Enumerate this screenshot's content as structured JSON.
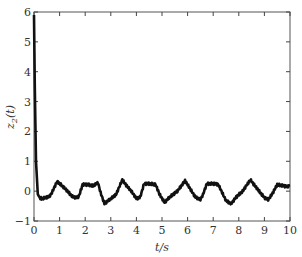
{
  "chart_data": {
    "type": "line",
    "title": "",
    "xlabel": "t/s",
    "ylabel": "z_2(t)",
    "ylabel_main": "z",
    "ylabel_sub": "2",
    "ylabel_tail": "(t)",
    "xlim": [
      0,
      10
    ],
    "ylim": [
      -1,
      6
    ],
    "xticks": [
      0,
      1,
      2,
      3,
      4,
      5,
      6,
      7,
      8,
      9,
      10
    ],
    "yticks": [
      -1,
      0,
      1,
      2,
      3,
      4,
      5,
      6
    ],
    "xtick_labels": [
      "0",
      "1",
      "2",
      "3",
      "4",
      "5",
      "6",
      "7",
      "8",
      "9",
      "10"
    ],
    "ytick_labels": [
      "−1",
      "0",
      "1",
      "2",
      "3",
      "4",
      "5",
      "6"
    ],
    "grid": false,
    "legend": null,
    "series": [
      {
        "name": "z2(t)",
        "color": "#111111",
        "x": [
          0,
          0.03,
          0.08,
          0.15,
          0.22,
          0.3,
          0.45,
          0.6,
          0.7,
          0.9,
          1.05,
          1.25,
          1.5,
          1.65,
          1.75,
          1.9,
          2.1,
          2.3,
          2.5,
          2.6,
          2.75,
          3.0,
          3.2,
          3.45,
          3.6,
          3.8,
          4.0,
          4.15,
          4.3,
          4.5,
          4.75,
          4.9,
          5.1,
          5.3,
          5.6,
          5.9,
          6.05,
          6.3,
          6.5,
          6.6,
          6.75,
          7.0,
          7.2,
          7.5,
          7.7,
          7.9,
          8.15,
          8.45,
          8.7,
          9.0,
          9.15,
          9.3,
          9.5,
          9.75,
          9.9,
          10.0
        ],
        "y": [
          5.9,
          3.5,
          1.0,
          -0.1,
          -0.22,
          -0.25,
          -0.22,
          -0.18,
          -0.05,
          0.32,
          0.22,
          0.05,
          -0.18,
          -0.22,
          -0.18,
          0.22,
          0.22,
          0.18,
          0.28,
          -0.05,
          -0.42,
          -0.25,
          -0.12,
          0.38,
          0.2,
          0.0,
          -0.25,
          -0.2,
          0.25,
          0.25,
          0.22,
          -0.1,
          -0.38,
          -0.2,
          0.0,
          0.35,
          0.15,
          -0.2,
          -0.28,
          -0.12,
          0.25,
          0.25,
          0.22,
          -0.32,
          -0.42,
          -0.2,
          0.0,
          0.38,
          0.1,
          -0.22,
          -0.28,
          -0.1,
          0.22,
          0.18,
          0.15,
          0.2
        ]
      }
    ]
  }
}
